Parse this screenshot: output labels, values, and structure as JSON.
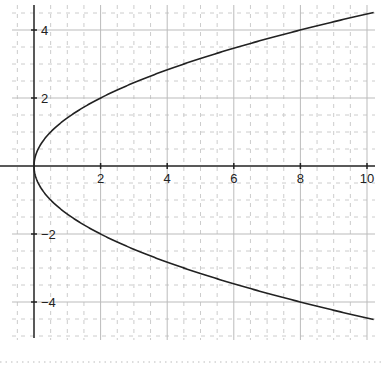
{
  "chart_data": {
    "type": "line",
    "title": "",
    "xlabel": "",
    "ylabel": "",
    "equation": "y^2 = 2x",
    "xlim": [
      -0.65,
      10.2
    ],
    "ylim": [
      -5.2,
      4.75
    ],
    "grid": {
      "major_step": 2,
      "minor_step": 0.5,
      "on": true
    },
    "x_ticks": [
      2,
      4,
      6,
      8,
      10
    ],
    "x_tick_labels": [
      "2",
      "4",
      "6",
      "8",
      "10"
    ],
    "y_ticks": [
      -4,
      -2,
      2,
      4
    ],
    "y_tick_labels": [
      "−4",
      "−2",
      "2",
      "4"
    ],
    "series": [
      {
        "name": "upper branch",
        "x": [
          0,
          0.5,
          1,
          2,
          4,
          6,
          8,
          10
        ],
        "values": [
          0,
          1,
          1.41,
          2,
          2.83,
          3.46,
          4,
          4.47
        ]
      },
      {
        "name": "lower branch",
        "x": [
          0,
          0.5,
          1,
          2,
          4,
          6,
          8,
          10
        ],
        "values": [
          0,
          -1,
          -1.41,
          -2,
          -2.83,
          -3.46,
          -4,
          -4.47
        ]
      }
    ],
    "colors": {
      "curve": "#222222",
      "axis": "#222222",
      "major_grid": "#bbbbbb",
      "minor_grid": "#cccccc",
      "footer_dots": "#bbbbbb"
    }
  }
}
